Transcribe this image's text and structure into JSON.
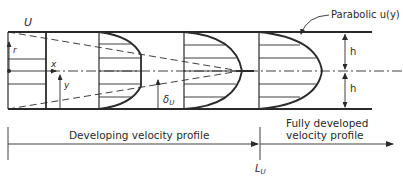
{
  "diagram": {
    "labels": {
      "inlet_velocity": "U",
      "radial_coord": "r",
      "axial_coord": "x",
      "transverse_coord": "y",
      "boundary_layer": "δ",
      "boundary_layer_sub": "U",
      "parabolic_callout": "Parabolic  u(y)",
      "half_height_top": "h",
      "half_height_bottom": "h",
      "developing_region": "Developing velocity profile",
      "developed_region_line1": "Fully developed",
      "developed_region_line2": "velocity profile",
      "entrance_length": "L",
      "entrance_length_sub": "U"
    },
    "colors": {
      "ink": "#2a2a2a",
      "background": "#ffffff"
    }
  }
}
